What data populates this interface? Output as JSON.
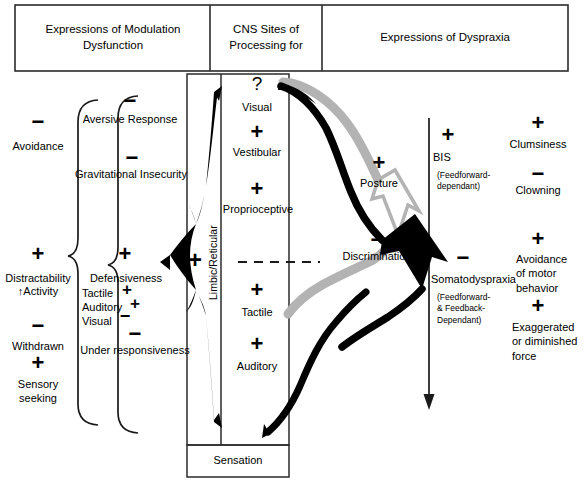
{
  "figure": {
    "title_columns": [
      {
        "id": "col-modulation",
        "label": "Expressions of Modulation Dysfunction"
      },
      {
        "id": "col-cns",
        "label": "CNS Sites of Processing for"
      },
      {
        "id": "col-dyspraxia",
        "label": "Expressions of Dyspraxia"
      }
    ],
    "colors": {
      "ink": "#1a1a1a",
      "gray_arrow": "#b3b3b3",
      "black_arrow": "#000000",
      "rule": "#333333"
    }
  },
  "left_column": {
    "outer_items": [
      {
        "sign": "−",
        "label": "Avoidance"
      },
      {
        "sign": "+",
        "label": "Distractability",
        "label2": "↑Activity"
      },
      {
        "sign": "−",
        "label": "Withdrawn"
      },
      {
        "sign": "+",
        "label": "Sensory seeking"
      }
    ],
    "braced_items": [
      {
        "sign": "−",
        "label": "Aversive Response"
      },
      {
        "sign": "−",
        "label": "Gravitational Insecurity"
      },
      {
        "sign": "+",
        "label": "Defensiveness",
        "sub": [
          {
            "label": "Tactile",
            "sign": "+"
          },
          {
            "label": "Auditory",
            "sign": "+"
          },
          {
            "label": "Visual",
            "sign": "−"
          }
        ]
      },
      {
        "sign": "−",
        "label": "Under responsiveness"
      }
    ]
  },
  "center_column": {
    "title": "CNS Sites of Processing for",
    "band_label": "Limbic/Reticular",
    "modulation_plus": "+",
    "items": [
      {
        "sign": "?",
        "label": "Visual"
      },
      {
        "sign": "+",
        "label": "Vestibular"
      },
      {
        "sign": "+",
        "label": "Proprioceptive"
      },
      {
        "sign": "+",
        "label": "Tactile"
      },
      {
        "sign": "+",
        "label": "Auditory"
      }
    ],
    "footer_box": "Sensation"
  },
  "middle_outcomes": [
    {
      "sign": "+",
      "label": "Posture"
    },
    {
      "sign": "−",
      "label": "Discrimination"
    }
  ],
  "right_column": {
    "axis_items": [
      {
        "sign": "+",
        "label": "BIS",
        "note": "(Feedforward-dependant)"
      },
      {
        "sign": "−",
        "label": "Somatodyspraxia",
        "note": "(Feedforward- & Feedback-Dependant)"
      }
    ],
    "braced_items": [
      {
        "sign": "+",
        "label": "Clumsiness"
      },
      {
        "sign": "−",
        "label": "Clowning"
      },
      {
        "sign": "+",
        "label": "Avoidance of motor behavior"
      },
      {
        "sign": "+",
        "label": "Exaggerated or diminished force"
      }
    ]
  }
}
